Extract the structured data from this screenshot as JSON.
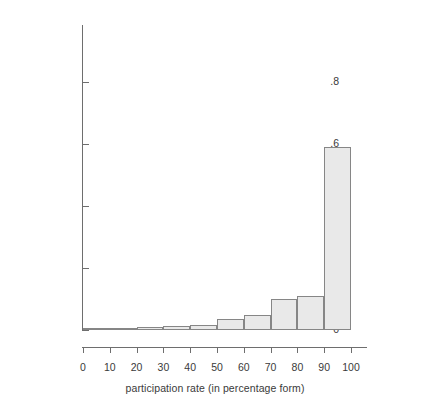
{
  "chart_data": {
    "type": "bar",
    "title": "",
    "subtitle": "",
    "xlabel": "participation rate (in percentage form)",
    "ylabel": "proportion in cell",
    "grid": false,
    "legend": null,
    "xlim": [
      0,
      100
    ],
    "ylim": [
      0,
      1.0
    ],
    "yticks": [
      0,
      0.2,
      0.4,
      0.6,
      0.8
    ],
    "ytick_labels": [
      "0",
      ".2",
      ".4",
      ".6",
      ".8"
    ],
    "xticks": [
      0,
      10,
      20,
      30,
      40,
      50,
      60,
      70,
      80,
      90,
      100
    ],
    "xtick_labels": [
      "0",
      "10",
      "20",
      "30",
      "40",
      "50",
      "60",
      "70",
      "80",
      "90",
      "100"
    ],
    "bin_width": 10,
    "categories": [
      "0-10",
      "10-20",
      "20-30",
      "30-40",
      "40-50",
      "50-60",
      "60-70",
      "70-80",
      "80-90",
      "90-100"
    ],
    "bin_starts": [
      0,
      10,
      20,
      30,
      40,
      50,
      60,
      70,
      80,
      90
    ],
    "values": [
      0.0,
      0.002,
      0.01,
      0.013,
      0.017,
      0.035,
      0.05,
      0.1,
      0.11,
      0.59
    ],
    "bars": [
      {
        "label": "0-10",
        "start": 0,
        "end": 10,
        "value": 0.0
      },
      {
        "label": "10-20",
        "start": 10,
        "end": 20,
        "value": 0.002
      },
      {
        "label": "20-30",
        "start": 20,
        "end": 30,
        "value": 0.01
      },
      {
        "label": "30-40",
        "start": 30,
        "end": 40,
        "value": 0.013
      },
      {
        "label": "40-50",
        "start": 40,
        "end": 50,
        "value": 0.017
      },
      {
        "label": "50-60",
        "start": 50,
        "end": 60,
        "value": 0.035
      },
      {
        "label": "60-70",
        "start": 60,
        "end": 70,
        "value": 0.05
      },
      {
        "label": "70-80",
        "start": 70,
        "end": 80,
        "value": 0.1
      },
      {
        "label": "80-90",
        "start": 80,
        "end": 90,
        "value": 0.11
      },
      {
        "label": "90-100",
        "start": 90,
        "end": 100,
        "value": 0.59
      }
    ],
    "colors": {
      "bar_fill": "#e9e9e9",
      "bar_edge": "#868686",
      "axis": "#6e6e6e",
      "text": "#3a3a3a",
      "background": "#ffffff"
    }
  }
}
